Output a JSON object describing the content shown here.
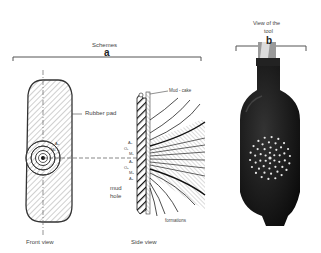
{
  "figure": {
    "panel_a": {
      "title": "Schemes",
      "letter": "a",
      "front_view": {
        "caption": "Front view",
        "label_rubber_pad": "Rubber pad"
      },
      "side_view": {
        "caption": "Side view",
        "label_mudcake": "Mud - cake",
        "label_mud": "mud",
        "label_hole": "hole",
        "label_formations": "formations",
        "electrode_labels": [
          "A₀",
          "O₁",
          "M₁",
          "A₁",
          "O₂",
          "M₂",
          "A₂"
        ]
      }
    },
    "panel_b": {
      "title_line1": "View of the",
      "title_line2": "tool",
      "letter": "b"
    }
  }
}
